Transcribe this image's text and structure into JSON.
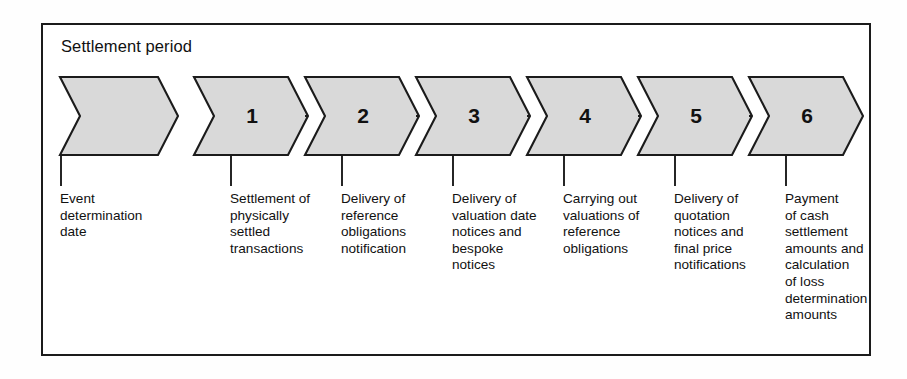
{
  "diagram": {
    "title": "Settlement period",
    "colors": {
      "chevron_fill": "#d9d9d9",
      "stroke": "#1b1b1b",
      "background": "#ffffff",
      "text": "#111111"
    }
  },
  "chart_data": {
    "type": "diagram",
    "subtype": "chevron-process-flow",
    "title": "Settlement period",
    "orientation": "horizontal",
    "step_count": 7,
    "numbered_steps": 6,
    "steps": [
      {
        "index": 0,
        "number": "",
        "label": "Event\ndetermination\ndate",
        "label_lines": [
          "Event",
          "determination",
          "date"
        ],
        "numbered": false,
        "connected_to_next": false
      },
      {
        "index": 1,
        "number": "1",
        "label": "Settlement of\nphysically\nsettled\ntransactions",
        "label_lines": [
          "Settlement of",
          "physically",
          "settled",
          "transactions"
        ],
        "numbered": true,
        "connected_to_next": true
      },
      {
        "index": 2,
        "number": "2",
        "label": "Delivery of\nreference\nobligations\nnotification",
        "label_lines": [
          "Delivery of",
          "reference",
          "obligations",
          "notification"
        ],
        "numbered": true,
        "connected_to_next": true
      },
      {
        "index": 3,
        "number": "3",
        "label": "Delivery of\nvaluation date\nnotices and\nbespoke\nnotices",
        "label_lines": [
          "Delivery of",
          "valuation date",
          "notices and",
          "bespoke",
          "notices"
        ],
        "numbered": true,
        "connected_to_next": true
      },
      {
        "index": 4,
        "number": "4",
        "label": "Carrying out\nvaluations of\nreference\nobligations",
        "label_lines": [
          "Carrying out",
          "valuations of",
          "reference",
          "obligations"
        ],
        "numbered": true,
        "connected_to_next": true
      },
      {
        "index": 5,
        "number": "5",
        "label": "Delivery of\nquotation\nnotices and\nfinal price\nnotifications",
        "label_lines": [
          "Delivery of",
          "quotation",
          "notices and",
          "final price",
          "notifications"
        ],
        "numbered": true,
        "connected_to_next": true
      },
      {
        "index": 6,
        "number": "6",
        "label": "Payment\nof cash\nsettlement\namounts and\ncalculation\nof loss\ndetermination\namounts",
        "label_lines": [
          "Payment",
          "of cash",
          "settlement",
          "amounts and",
          "calculation",
          "of loss",
          "determination",
          "amounts"
        ],
        "numbered": true,
        "connected_to_next": false
      }
    ]
  }
}
